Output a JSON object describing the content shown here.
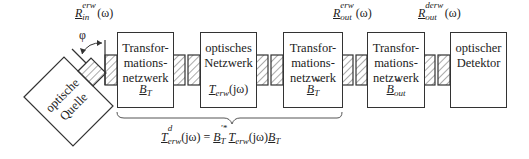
{
  "diagram": {
    "source": {
      "line1": "optische",
      "line2": "Quelle"
    },
    "angle_symbol": "φ",
    "label_in": {
      "base": "R",
      "sup": "erw",
      "sub": "in",
      "arg": "(ω)"
    },
    "label_out": {
      "base": "R",
      "sup": "erw",
      "sub": "out",
      "arg": "(ω)"
    },
    "label_dout": {
      "base": "R",
      "sup": "derw",
      "sub": "out",
      "arg": "(ω)"
    },
    "blocks": [
      {
        "line1": "Transfor-",
        "line2": "mations-",
        "line3": "netzwerk",
        "sym_base": "B",
        "sym_sub": "T",
        "sym_sup": ""
      },
      {
        "line1": "optisches",
        "line2": "Netzwerk",
        "line3": "",
        "sym_base": "T",
        "sym_sub": "erw",
        "sym_arg": "(jω)"
      },
      {
        "line1": "Transfor-",
        "line2": "mations-",
        "line3": "netzwerk",
        "sym_base": "B",
        "sym_sub": "T",
        "sym_sup": "'*"
      },
      {
        "line1": "Transfor-",
        "line2": "mations-",
        "line3": "netzwerk",
        "sym_base": "B",
        "sym_sub": "out",
        "sym_sup": "'*"
      },
      {
        "line1": "optischer",
        "line2": "Detektor",
        "line3": ""
      }
    ],
    "equation": {
      "lhs_base": "T",
      "lhs_sup": "d",
      "lhs_sub": "erw",
      "lhs_arg": "(jω)",
      "eq": " = ",
      "t1_base": "B",
      "t1_sub": "T",
      "t1_sup": "'*",
      "t2_base": "T",
      "t2_sub": "erw",
      "t2_arg": "(jω)",
      "t3_base": "B",
      "t3_sub": "T"
    }
  }
}
